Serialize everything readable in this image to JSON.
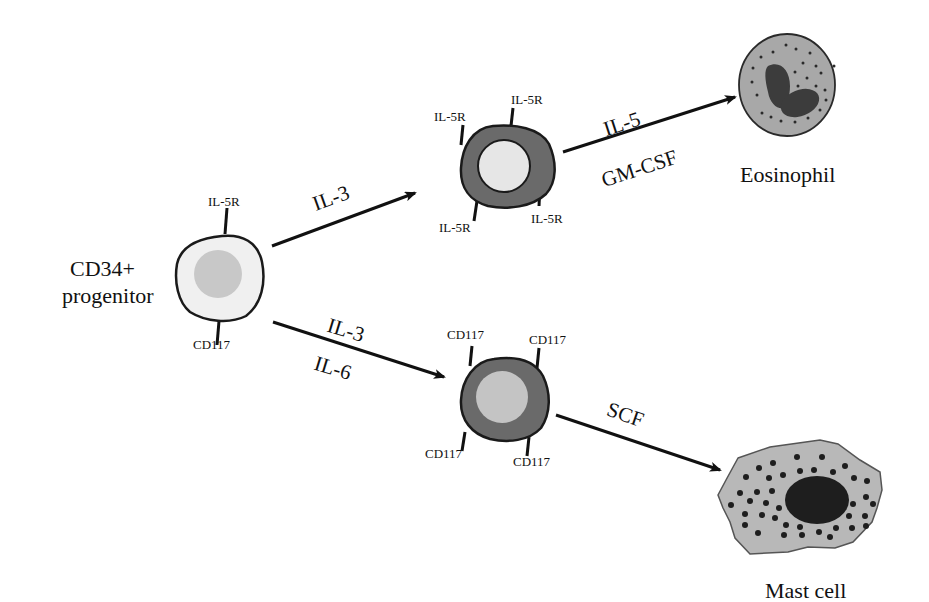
{
  "diagram": {
    "type": "cell-differentiation-flow",
    "colors": {
      "background": "#ffffff",
      "outline": "#1a1a1a",
      "progenitor_cytoplasm": "#f0f0f0",
      "progenitor_nucleus": "#c8c8c8",
      "intermediate_ring": "#6a6a6a",
      "intermediate_nucleus_eos": "#e6e6e6",
      "intermediate_nucleus_mast": "#c4c4c4",
      "eosinophil_cytoplasm": "#a8a8a8",
      "eosinophil_nucleus": "#3c3c3c",
      "mast_cytoplasm": "#b8b8b8",
      "mast_nucleus": "#1e1e1e",
      "granule": "#2a2a2a",
      "arrow": "#111111"
    },
    "nodes": {
      "progenitor": {
        "label_line1": "CD34+",
        "label_line2": "progenitor",
        "receptor_top": "IL-5R",
        "receptor_bottom": "CD117"
      },
      "eos_precursor": {
        "receptors": [
          "IL-5R",
          "IL-5R",
          "IL-5R",
          "IL-5R"
        ]
      },
      "mast_precursor": {
        "receptors": [
          "CD117",
          "CD117",
          "CD117",
          "CD117"
        ]
      },
      "eosinophil": {
        "label": "Eosinophil"
      },
      "mast_cell": {
        "label": "Mast cell"
      }
    },
    "edges": [
      {
        "from": "progenitor",
        "to": "eos_precursor",
        "label_above": "IL-3",
        "label_below": ""
      },
      {
        "from": "eos_precursor",
        "to": "eosinophil",
        "label_above": "IL-5",
        "label_below": "GM-CSF"
      },
      {
        "from": "progenitor",
        "to": "mast_precursor",
        "label_above": "IL-3",
        "label_below": "IL-6"
      },
      {
        "from": "mast_precursor",
        "to": "mast_cell",
        "label_above": "SCF",
        "label_below": ""
      }
    ]
  }
}
